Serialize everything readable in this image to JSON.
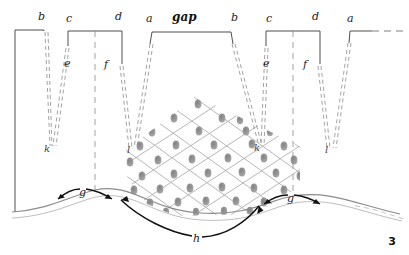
{
  "figure": {
    "title": "gap",
    "page_number": "3",
    "colors": {
      "ink_dark": "#1c1c1c",
      "ink_mid": "#555555",
      "ink_light": "#9a9a9a",
      "lattice": "#9d9d9d",
      "lattice_dot": "#7d7d7d",
      "surface_curve": "#8c8c8c"
    }
  },
  "labels": {
    "top": [
      {
        "id": "b1",
        "text": "b",
        "x": 38,
        "y": 14
      },
      {
        "id": "c1",
        "text": "c",
        "x": 66,
        "y": 16
      },
      {
        "id": "d1",
        "text": "d",
        "x": 115,
        "y": 14
      },
      {
        "id": "a1",
        "text": "a",
        "x": 146,
        "y": 16
      },
      {
        "id": "gap",
        "text": "gap",
        "x": 176,
        "y": 14
      },
      {
        "id": "b2",
        "text": "b",
        "x": 231,
        "y": 15
      },
      {
        "id": "c2",
        "text": "c",
        "x": 266,
        "y": 16
      },
      {
        "id": "d2",
        "text": "d",
        "x": 312,
        "y": 14
      },
      {
        "id": "a2",
        "text": "a",
        "x": 347,
        "y": 16
      }
    ],
    "mid": [
      {
        "id": "e1",
        "text": "e",
        "x": 67,
        "y": 63
      },
      {
        "id": "f1",
        "text": "f",
        "x": 104,
        "y": 62
      },
      {
        "id": "e2",
        "text": "e",
        "x": 266,
        "y": 63
      },
      {
        "id": "f2",
        "text": "f",
        "x": 303,
        "y": 62
      }
    ],
    "lower": [
      {
        "id": "k1",
        "text": "k",
        "x": 45,
        "y": 147
      },
      {
        "id": "l1",
        "text": "l",
        "x": 127,
        "y": 148
      },
      {
        "id": "k2",
        "text": "k",
        "x": 255,
        "y": 146
      },
      {
        "id": "l2",
        "text": "l",
        "x": 325,
        "y": 148
      }
    ],
    "surface": [
      {
        "id": "g1",
        "text": "g",
        "x": 79,
        "y": 196
      },
      {
        "id": "h",
        "text": "h",
        "x": 194,
        "y": 240
      },
      {
        "id": "g2",
        "text": "g",
        "x": 287,
        "y": 202
      }
    ]
  },
  "legend_meaning": {
    "a": "period / unit cell edge",
    "b": "rising edge",
    "c": "plateau start",
    "d": "plateau end",
    "e": "inner slope marker",
    "f": "inner slope marker",
    "g": "half period on surface",
    "h": "valley span on surface",
    "k": "lower convergence point left",
    "l": "lower convergence point right",
    "gap": "gap between adjacent combs"
  },
  "lattice": {
    "rows": 7,
    "cols": 9,
    "dot_count": 44,
    "orientation": "diagonal cross-hatch",
    "bounds": {
      "x": 122,
      "y": 96,
      "w": 180,
      "h": 120
    }
  }
}
